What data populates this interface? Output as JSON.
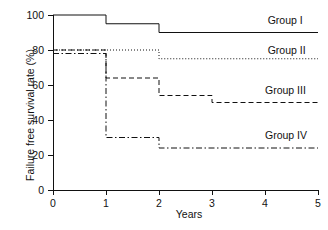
{
  "chart_data": {
    "type": "line",
    "title": "",
    "xlabel": "Years",
    "ylabel": "Failure free survival rate (%)",
    "xlim": [
      0,
      5
    ],
    "ylim": [
      0,
      100
    ],
    "xticks": [
      "0",
      "1",
      "2",
      "3",
      "4",
      "5"
    ],
    "yticks": [
      "0",
      "20",
      "40",
      "60",
      "80",
      "100"
    ],
    "grid": false,
    "legend_position": "right-inline",
    "step_style": "post",
    "series": [
      {
        "name": "Group I",
        "linestyle": "solid",
        "color": "#111111",
        "x": [
          0,
          1,
          1,
          2,
          2,
          5
        ],
        "y": [
          100,
          100,
          95,
          95,
          90,
          90
        ],
        "label_x": 4.05,
        "label_y": 95
      },
      {
        "name": "Group II",
        "linestyle": "dotted",
        "color": "#111111",
        "x": [
          0,
          2,
          2,
          5
        ],
        "y": [
          80,
          80,
          75,
          75
        ],
        "label_x": 4.05,
        "label_y": 78
      },
      {
        "name": "Group III",
        "linestyle": "dashed",
        "color": "#111111",
        "x": [
          0,
          1,
          1,
          2,
          2,
          3,
          3,
          5
        ],
        "y": [
          80,
          80,
          64,
          64,
          54,
          54,
          50,
          50
        ],
        "label_x": 4.0,
        "label_y": 55
      },
      {
        "name": "Group IV",
        "linestyle": "dashdot",
        "color": "#111111",
        "x": [
          0,
          1,
          1,
          2,
          2,
          5
        ],
        "y": [
          78,
          78,
          30,
          30,
          24,
          24
        ],
        "label_x": 4.0,
        "label_y": 29
      }
    ]
  }
}
